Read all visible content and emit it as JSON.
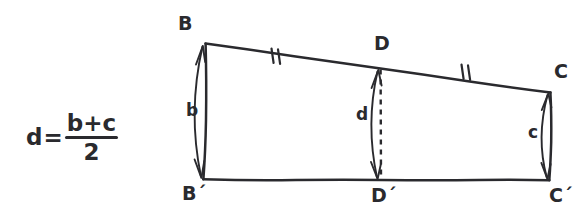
{
  "figure": {
    "kind": "hand-drawn-geometry-diagram",
    "ink_color": "#2a2a2e",
    "background_color": "#ffffff",
    "formula": {
      "lhs": "d",
      "equals": "=",
      "numerator": "b+c",
      "denominator": "2",
      "plain_text": "d=(b+c)/2"
    },
    "vertices": [
      {
        "id": "B",
        "label": "B",
        "x": 205,
        "y": 44,
        "label_x": 178,
        "label_y": 14
      },
      {
        "id": "D",
        "label": "D",
        "x": 380,
        "y": 68,
        "label_x": 374,
        "label_y": 34
      },
      {
        "id": "C",
        "label": "C",
        "x": 550,
        "y": 92,
        "label_x": 554,
        "label_y": 62
      },
      {
        "id": "B'",
        "label": "B´",
        "x": 203,
        "y": 179,
        "label_x": 182,
        "label_y": 184
      },
      {
        "id": "D'",
        "label": "D´",
        "x": 381,
        "y": 180,
        "label_x": 371,
        "label_y": 186
      },
      {
        "id": "C'",
        "label": "C´",
        "x": 549,
        "y": 180,
        "label_x": 549,
        "label_y": 186
      }
    ],
    "segment_labels": [
      {
        "id": "b",
        "label": "b",
        "x": 186,
        "y": 102,
        "describes": "left side B to B-prime"
      },
      {
        "id": "d",
        "label": "d",
        "x": 356,
        "y": 106,
        "describes": "midline D to D-prime"
      },
      {
        "id": "c",
        "label": "c",
        "x": 528,
        "y": 124,
        "describes": "right side C to C-prime"
      }
    ],
    "tick_marks": [
      {
        "id": "tick-BD",
        "on_segment": "B-D",
        "count": 2,
        "x": 274,
        "y": 56
      },
      {
        "id": "tick-DC",
        "on_segment": "D-C",
        "count": 2,
        "x": 464,
        "y": 72
      }
    ],
    "edges": [
      {
        "id": "top",
        "from": "B",
        "to": "C",
        "style": "solid"
      },
      {
        "id": "left",
        "from": "B",
        "to": "B'",
        "style": "solid"
      },
      {
        "id": "right",
        "from": "C",
        "to": "C'",
        "style": "solid"
      },
      {
        "id": "bottom",
        "from": "B'",
        "to": "C'",
        "style": "solid"
      },
      {
        "id": "midline",
        "from": "D",
        "to": "D'",
        "style": "dashed"
      }
    ],
    "measure_arrows": [
      {
        "id": "b-measure",
        "label": "b",
        "double_headed": true
      },
      {
        "id": "d-measure",
        "label": "d",
        "double_headed": true
      },
      {
        "id": "c-measure",
        "label": "c",
        "double_headed": true
      }
    ]
  }
}
